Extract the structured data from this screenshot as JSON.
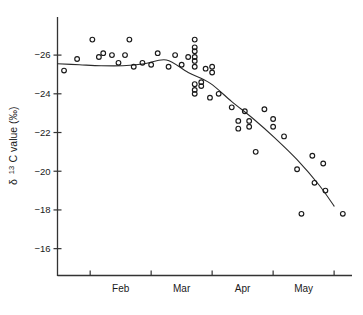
{
  "chart_data": {
    "type": "scatter",
    "title": "",
    "xlabel": "",
    "ylabel": "δ 13C value (‰)",
    "ylabel_parts": {
      "delta": "δ",
      "superscript": "13",
      "element": "C value (‰)"
    },
    "ylim": [
      -27.4,
      -15.0
    ],
    "yticks": [
      -26,
      -24,
      -22,
      -20,
      -18,
      -16
    ],
    "ytick_labels": [
      "−26",
      "−24",
      "−22",
      "−20",
      "−18",
      "−16"
    ],
    "y_axis_inverted": true,
    "xlim": [
      0,
      132
    ],
    "xticks": [
      15,
      43,
      71,
      99,
      127
    ],
    "xtick_labels": [
      "",
      "",
      "",
      "",
      ""
    ],
    "month_labels": [
      "Feb",
      "Mar",
      "Apr",
      "May"
    ],
    "month_positions": [
      29,
      57,
      85,
      113
    ],
    "grid": false,
    "legend": null,
    "marker_style": "open-circle",
    "series": [
      {
        "name": "δ 13C observations",
        "marker": "open-circle",
        "points": [
          {
            "x": 3,
            "y": -25.2
          },
          {
            "x": 9,
            "y": -25.8
          },
          {
            "x": 16,
            "y": -26.8
          },
          {
            "x": 19,
            "y": -25.9
          },
          {
            "x": 21,
            "y": -26.1
          },
          {
            "x": 25,
            "y": -26.0
          },
          {
            "x": 28,
            "y": -25.6
          },
          {
            "x": 31,
            "y": -26.0
          },
          {
            "x": 33,
            "y": -26.8
          },
          {
            "x": 35,
            "y": -25.4
          },
          {
            "x": 39,
            "y": -25.6
          },
          {
            "x": 43,
            "y": -25.5
          },
          {
            "x": 46,
            "y": -26.1
          },
          {
            "x": 51,
            "y": -25.4
          },
          {
            "x": 54,
            "y": -26.0
          },
          {
            "x": 57,
            "y": -25.5
          },
          {
            "x": 60,
            "y": -25.9
          },
          {
            "x": 63,
            "y": -26.8
          },
          {
            "x": 63,
            "y": -26.4
          },
          {
            "x": 63,
            "y": -26.2
          },
          {
            "x": 63,
            "y": -25.9
          },
          {
            "x": 63,
            "y": -25.7
          },
          {
            "x": 63,
            "y": -25.4
          },
          {
            "x": 63,
            "y": -24.5
          },
          {
            "x": 63,
            "y": -24.2
          },
          {
            "x": 63,
            "y": -24.0
          },
          {
            "x": 66,
            "y": -24.6
          },
          {
            "x": 66,
            "y": -24.4
          },
          {
            "x": 68,
            "y": -25.3
          },
          {
            "x": 70,
            "y": -23.8
          },
          {
            "x": 71,
            "y": -25.4
          },
          {
            "x": 71,
            "y": -25.1
          },
          {
            "x": 74,
            "y": -24.0
          },
          {
            "x": 80,
            "y": -23.3
          },
          {
            "x": 83,
            "y": -22.6
          },
          {
            "x": 83,
            "y": -22.2
          },
          {
            "x": 86,
            "y": -23.1
          },
          {
            "x": 88,
            "y": -22.6
          },
          {
            "x": 88,
            "y": -22.3
          },
          {
            "x": 91,
            "y": -21.0
          },
          {
            "x": 95,
            "y": -23.2
          },
          {
            "x": 99,
            "y": -22.7
          },
          {
            "x": 99,
            "y": -22.3
          },
          {
            "x": 104,
            "y": -21.8
          },
          {
            "x": 110,
            "y": -20.1
          },
          {
            "x": 112,
            "y": -17.8
          },
          {
            "x": 117,
            "y": -20.8
          },
          {
            "x": 118,
            "y": -19.4
          },
          {
            "x": 122,
            "y": -20.4
          },
          {
            "x": 123,
            "y": -19.0
          },
          {
            "x": 131,
            "y": -17.8
          }
        ]
      }
    ],
    "fit_curve": {
      "name": "fitted trend",
      "points": [
        {
          "x": 0,
          "y": -25.55
        },
        {
          "x": 10,
          "y": -25.5
        },
        {
          "x": 20,
          "y": -25.45
        },
        {
          "x": 30,
          "y": -25.45
        },
        {
          "x": 40,
          "y": -25.55
        },
        {
          "x": 50,
          "y": -25.75
        },
        {
          "x": 60,
          "y": -25.1
        },
        {
          "x": 70,
          "y": -24.55
        },
        {
          "x": 80,
          "y": -23.6
        },
        {
          "x": 90,
          "y": -22.7
        },
        {
          "x": 100,
          "y": -21.7
        },
        {
          "x": 110,
          "y": -20.6
        },
        {
          "x": 120,
          "y": -19.3
        },
        {
          "x": 127,
          "y": -18.2
        }
      ]
    }
  }
}
